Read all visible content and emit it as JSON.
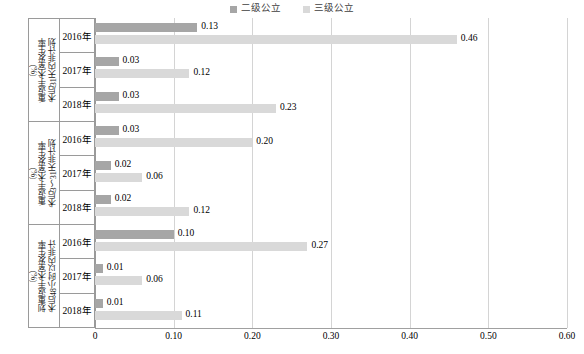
{
  "legend": {
    "items": [
      {
        "label": "二级公立",
        "color": "#a6a6a6",
        "icon": "legend-square-icon"
      },
      {
        "label": "三级公立",
        "color": "#d9d9d9",
        "icon": "legend-square-icon"
      }
    ]
  },
  "colors": {
    "series_secondary": "#a6a6a6",
    "series_tertiary": "#d9d9d9",
    "gridline": "#d4d4d4",
    "axis": "#9a9a9a",
    "background": "#ffffff"
  },
  "axis": {
    "x_ticks": [
      "0",
      "0.10",
      "0.20",
      "0.30",
      "0.40",
      "0.50",
      "0.60"
    ],
    "x_min": 0,
    "x_max": 0.6,
    "x_step": 0.1
  },
  "groups": [
    {
      "title": "术后31天内非计划重返手术室发生率（%）",
      "title_line1": "术后31天内非计划",
      "title_line2": "重返手术室发生率",
      "title_line3": "（%）",
      "years": [
        {
          "label": "2016年",
          "secondary": 0.13,
          "tertiary": 0.46,
          "secondary_text": "0.13",
          "tertiary_text": "0.46"
        },
        {
          "label": "2017年",
          "secondary": 0.03,
          "tertiary": 0.12,
          "secondary_text": "0.03",
          "tertiary_text": "0.12"
        },
        {
          "label": "2018年",
          "secondary": 0.03,
          "tertiary": 0.23,
          "secondary_text": "0.03",
          "tertiary_text": "0.23"
        }
      ]
    },
    {
      "title": "术后3～31天非计划重返手术室发生率（%）",
      "title_line1": "术后3～31天非计划",
      "title_line2": "重返手术室发生率",
      "title_line3": "（%）",
      "years": [
        {
          "label": "2016年",
          "secondary": 0.03,
          "tertiary": 0.2,
          "secondary_text": "0.03",
          "tertiary_text": "0.20"
        },
        {
          "label": "2017年",
          "secondary": 0.02,
          "tertiary": 0.06,
          "secondary_text": "0.02",
          "tertiary_text": "0.06"
        },
        {
          "label": "2018年",
          "secondary": 0.02,
          "tertiary": 0.12,
          "secondary_text": "0.02",
          "tertiary_text": "0.12"
        }
      ]
    },
    {
      "title": "术后48小时以内非计划重返手术室发生率（%）",
      "title_line1": "术后48小时以内非计",
      "title_line2": "划重返手术室发生率",
      "title_line3": "（%）",
      "years": [
        {
          "label": "2016年",
          "secondary": 0.1,
          "tertiary": 0.27,
          "secondary_text": "0.10",
          "tertiary_text": "0.27"
        },
        {
          "label": "2017年",
          "secondary": 0.01,
          "tertiary": 0.06,
          "secondary_text": "0.01",
          "tertiary_text": "0.06"
        },
        {
          "label": "2018年",
          "secondary": 0.01,
          "tertiary": 0.11,
          "secondary_text": "0.01",
          "tertiary_text": "0.11"
        }
      ]
    }
  ],
  "chart_data": {
    "type": "bar",
    "orientation": "horizontal",
    "title": "",
    "xlabel": "",
    "ylabel": "",
    "xlim": [
      0,
      0.6
    ],
    "grid": true,
    "legend_position": "top-center",
    "categories": [
      "术后31天内非计划重返手术室发生率（%） / 2016年",
      "术后31天内非计划重返手术室发生率（%） / 2017年",
      "术后31天内非计划重返手术室发生率（%） / 2018年",
      "术后3～31天非计划重返手术室发生率（%） / 2016年",
      "术后3～31天非计划重返手术室发生率（%） / 2017年",
      "术后3～31天非计划重返手术室发生率（%） / 2018年",
      "术后48小时以内非计划重返手术室发生率（%） / 2016年",
      "术后48小时以内非计划重返手术室发生率（%） / 2017年",
      "术后48小时以内非计划重返手术室发生率（%） / 2018年"
    ],
    "series": [
      {
        "name": "二级公立",
        "color": "#a6a6a6",
        "values": [
          0.13,
          0.03,
          0.03,
          0.03,
          0.02,
          0.02,
          0.1,
          0.01,
          0.01
        ]
      },
      {
        "name": "三级公立",
        "color": "#d9d9d9",
        "values": [
          0.46,
          0.12,
          0.23,
          0.2,
          0.06,
          0.12,
          0.27,
          0.06,
          0.11
        ]
      }
    ],
    "xtick_labels": [
      "0",
      "0.10",
      "0.20",
      "0.30",
      "0.40",
      "0.50",
      "0.60"
    ],
    "xtick_values": [
      0,
      0.1,
      0.2,
      0.3,
      0.4,
      0.5,
      0.6
    ]
  }
}
